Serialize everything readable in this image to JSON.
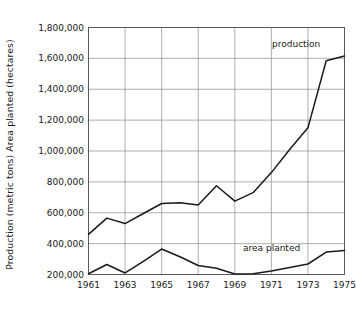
{
  "chart_data": {
    "type": "line",
    "title": "",
    "subtitle": "",
    "xlabel": "",
    "ylabel": "Production (metric tons)  Area planted (hectares)",
    "xlim": [
      1961,
      1975
    ],
    "ylim": [
      200000,
      1800000
    ],
    "grid": true,
    "legend_position": "inline-annotations",
    "x": [
      1961,
      1962,
      1963,
      1964,
      1965,
      1966,
      1967,
      1968,
      1969,
      1970,
      1971,
      1972,
      1973,
      1974,
      1975
    ],
    "xticks": [
      1961,
      1963,
      1965,
      1967,
      1969,
      1971,
      1973,
      1975
    ],
    "xtick_labels": [
      "1961",
      "1963",
      "1965",
      "1967",
      "1969",
      "1971",
      "1973",
      "1975"
    ],
    "yticks": [
      200000,
      400000,
      600000,
      800000,
      1000000,
      1200000,
      1400000,
      1600000,
      1800000
    ],
    "ytick_labels": [
      "1,800,000",
      "1,600,000",
      "1,400,000",
      "1,200,000",
      "1,000,000",
      "800,000",
      "600,000",
      "400,000",
      "200,000"
    ],
    "series": [
      {
        "name": "production",
        "label": "production",
        "color": "#1a1a1a",
        "values": [
          460000,
          565000,
          530000,
          595000,
          660000,
          665000,
          650000,
          775000,
          675000,
          730000,
          860000,
          1010000,
          1150000,
          1585000,
          1615000
        ]
      },
      {
        "name": "area planted",
        "label": "area planted",
        "color": "#1a1a1a",
        "values": [
          205000,
          265000,
          210000,
          285000,
          365000,
          315000,
          258000,
          240000,
          203000,
          205000,
          222000,
          245000,
          268000,
          345000,
          355000
        ]
      }
    ],
    "annotations": [
      {
        "text": "production",
        "series": "production"
      },
      {
        "text": "area planted",
        "series": "area planted"
      }
    ]
  },
  "colors": {
    "line": "#1a1a1a",
    "grid": "#9a9a9a",
    "axis": "#555555",
    "background": "#ffffff",
    "text": "#1a1a1a"
  }
}
